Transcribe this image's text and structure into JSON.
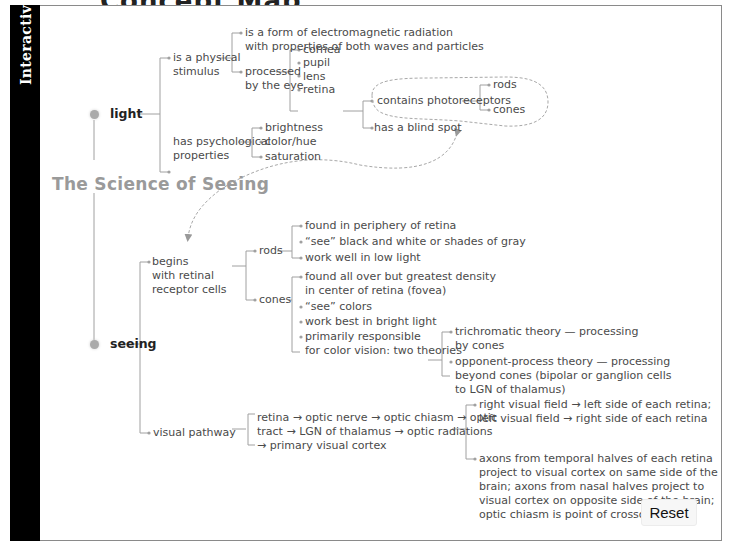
{
  "page": {
    "top_title_partial": "Concept Map",
    "sidebar_label": "Interactive",
    "diagram_title": "The Science of Seeing",
    "reset_label": "Reset"
  },
  "nodes": {
    "light": "light",
    "seeing": "seeing",
    "physical_stimulus": [
      "is a physical",
      "stimulus"
    ],
    "em_radiation": [
      "is a form of electromagnetic radiation",
      "with properties of both waves and particles"
    ],
    "processed_by_eye": [
      "processed",
      "by the eye"
    ],
    "eye_parts": [
      "cornea",
      "pupil",
      "lens",
      "retina"
    ],
    "contains_photoreceptors": "contains photoreceptors",
    "photoreceptors": [
      "rods",
      "cones"
    ],
    "blind_spot": "has a blind spot",
    "psychological": [
      "has psychological",
      "properties"
    ],
    "psych_props": [
      "brightness",
      "color/hue",
      "saturation"
    ],
    "begins_with": [
      "begins",
      "with retinal",
      "receptor cells"
    ],
    "rods_label": "rods",
    "rods_facts": [
      "found in periphery of retina",
      "“see” black and white or shades of gray",
      "work well in low light"
    ],
    "cones_label": "cones",
    "cones_fact1": [
      "found all over but greatest density",
      "in center of retina (fovea)"
    ],
    "cones_fact2": "“see” colors",
    "cones_fact3": "work best in bright light",
    "cones_fact4": [
      "primarily responsible",
      "for color vision: two theories"
    ],
    "trichromatic": [
      "trichromatic theory — processing",
      "by cones"
    ],
    "opponent": [
      "opponent-process theory — processing",
      "beyond cones (bipolar or ganglion cells",
      "to LGN of thalamus)"
    ],
    "visual_pathway": "visual pathway",
    "pathway_steps": [
      "retina → optic nerve → optic chiasm → optic",
      "tract → LGN of thalamus → optic radiations",
      "→ primary visual cortex"
    ],
    "visual_field": [
      "right visual field → left side of each retina;",
      "left visual field → right side of each retina"
    ],
    "axons": [
      "axons from temporal halves of each retina",
      "project to visual cortex on same side of the",
      "brain; axons from nasal halves project to",
      "visual cortex on opposite side of the brain;",
      "optic chiasm is point of crossover"
    ]
  },
  "colors": {
    "sidebar": "#000000",
    "line": "#9a9a9a",
    "title": "#9a9a9a",
    "dot": "#aaaaaa"
  }
}
